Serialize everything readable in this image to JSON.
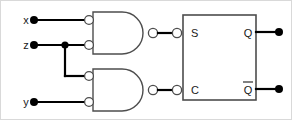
{
  "diagram": {
    "type": "logic-circuit-schematic",
    "background_color": "#ffffff",
    "wire_color": "#000000",
    "outline_color": "#4d4d4d",
    "inputs": [
      {
        "label": "x",
        "x": 25,
        "y": 19,
        "dot_x": 33,
        "dot_y": 19
      },
      {
        "label": "z",
        "x": 25,
        "y": 44,
        "dot_x": 33,
        "dot_y": 44
      },
      {
        "label": "y",
        "x": 25,
        "y": 101,
        "dot_x": 33,
        "dot_y": 101
      }
    ],
    "gates": [
      {
        "name": "gate-top",
        "kind": "nand-inverted-inputs",
        "inputs": [
          "x",
          "z"
        ],
        "output_to": "S"
      },
      {
        "name": "gate-bottom",
        "kind": "nand-inverted-inputs",
        "inputs": [
          "z",
          "y"
        ],
        "output_to": "C"
      }
    ],
    "block": {
      "name": "latch-block",
      "input_ports": [
        {
          "label": "S",
          "x": 190,
          "y": 31
        },
        {
          "label": "C",
          "x": 190,
          "y": 88
        }
      ],
      "output_ports": [
        {
          "label": "Q",
          "overbar": false,
          "x": 247,
          "y": 32
        },
        {
          "label": "Q",
          "overbar": true,
          "x": 247,
          "y": 88
        }
      ]
    },
    "outputs": [
      {
        "label": "Q",
        "dot_x": 278,
        "dot_y": 31
      },
      {
        "label": "Qbar",
        "dot_x": 278,
        "dot_y": 88
      }
    ],
    "junctions": [
      {
        "name": "z-fanout",
        "x": 64,
        "y": 44
      }
    ]
  }
}
